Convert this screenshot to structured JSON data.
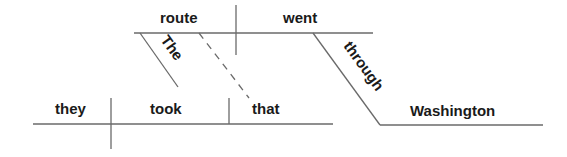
{
  "diagram": {
    "type": "sentence-diagram",
    "sentence": "They took the route that went through Washington",
    "line_color": "#6a6a6a",
    "text_color": "#1a1a1a",
    "main_clause": {
      "subject": "they",
      "verb": "took",
      "object": "that"
    },
    "relative_clause": {
      "subject": "route",
      "verb": "went",
      "modifier_of_subject": "The",
      "prepositional_phrase": {
        "preposition": "through",
        "object": "Washington"
      }
    }
  }
}
